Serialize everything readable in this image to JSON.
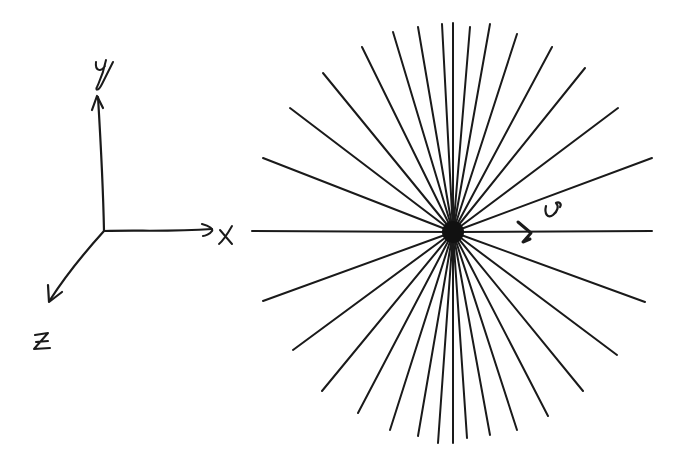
{
  "background_text": {
    "line1": "f. The act of wave expands the analogous electric",
    "line2": "a moving charge is stronger in the elec",
    "line3": "moving charge is stronger in the perpendicular dir"
  },
  "axes": {
    "origin": [
      104,
      231
    ],
    "x_label": "x",
    "y_label": "y",
    "z_label": "z"
  },
  "field": {
    "charge_center": [
      453,
      232
    ],
    "charge_radius": 11,
    "velocity_label": "v",
    "ink_color": "#1a1a1a",
    "line_endpoints": [
      [
        263,
        158
      ],
      [
        290,
        108
      ],
      [
        323,
        73
      ],
      [
        362,
        47
      ],
      [
        393,
        32
      ],
      [
        418,
        27
      ],
      [
        442,
        24
      ],
      [
        453,
        23
      ],
      [
        470,
        27
      ],
      [
        490,
        24
      ],
      [
        517,
        34
      ],
      [
        552,
        47
      ],
      [
        585,
        68
      ],
      [
        618,
        108
      ],
      [
        652,
        158
      ],
      [
        263,
        301
      ],
      [
        293,
        350
      ],
      [
        322,
        391
      ],
      [
        358,
        413
      ],
      [
        390,
        430
      ],
      [
        418,
        436
      ],
      [
        438,
        443
      ],
      [
        453,
        443
      ],
      [
        467,
        438
      ],
      [
        490,
        435
      ],
      [
        517,
        430
      ],
      [
        548,
        416
      ],
      [
        583,
        391
      ],
      [
        617,
        355
      ],
      [
        645,
        302
      ],
      [
        252,
        231
      ],
      [
        652,
        231
      ]
    ]
  }
}
